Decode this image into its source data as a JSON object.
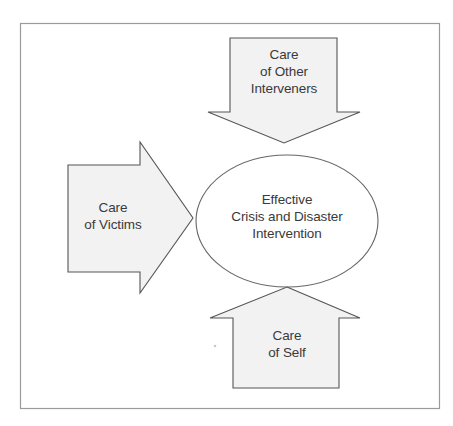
{
  "figure": {
    "background_color": "#ffffff",
    "frame": {
      "name": "outer-border",
      "x": 20,
      "y": 23,
      "width": 420,
      "height": 386,
      "stroke_color": "#9a9a9a"
    },
    "shape_fill_color": "#f2f2f2",
    "shape_stroke_color": "#555555",
    "text_color": "#3a3a3a"
  },
  "center": {
    "name": "effective-intervention-ellipse",
    "shape": "ellipse",
    "lines": [
      "Effective",
      "Crisis and Disaster",
      "Intervention"
    ],
    "line1": "Effective",
    "line2": "Crisis and Disaster",
    "line3": "Intervention",
    "cx": 287,
    "cy": 221,
    "rx": 91,
    "ry": 66,
    "fill": "#ffffff"
  },
  "arrows": [
    {
      "name": "care-of-other-interveners-arrow",
      "direction": "down",
      "lines": [
        "Care",
        "of Other",
        "Interveners"
      ],
      "line1": "Care",
      "line2": "of Other",
      "line3": "Interveners",
      "label_x": 284,
      "label_y": 59
    },
    {
      "name": "care-of-victims-arrow",
      "direction": "right",
      "lines": [
        "Care",
        "of Victims"
      ],
      "line1": "Care",
      "line2": "of Victims",
      "label_x": 117,
      "label_y": 212
    },
    {
      "name": "care-of-self-arrow",
      "direction": "up",
      "lines": [
        "Care",
        "of Self"
      ],
      "line1": "Care",
      "line2": "of Self",
      "label_x": 287,
      "label_y": 338
    }
  ]
}
